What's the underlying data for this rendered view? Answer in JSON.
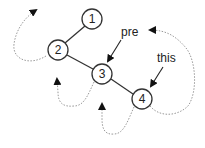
{
  "diagram": {
    "type": "binary-tree-traversal",
    "colors": {
      "edge": "#333333",
      "node_stroke": "#333333",
      "node_fill": "#ffffff",
      "traversal_path": "#999999",
      "arrowhead": "#111111",
      "text": "#222222"
    },
    "nodes": [
      {
        "id": "1",
        "label": "1",
        "cx": 92,
        "cy": 19
      },
      {
        "id": "2",
        "label": "2",
        "cx": 58,
        "cy": 50
      },
      {
        "id": "3",
        "label": "3",
        "cx": 102,
        "cy": 74
      },
      {
        "id": "4",
        "label": "4",
        "cx": 142,
        "cy": 99
      }
    ],
    "edges": [
      {
        "from": "1",
        "to": "2"
      },
      {
        "from": "2",
        "to": "3"
      },
      {
        "from": "3",
        "to": "4"
      }
    ],
    "pointers": [
      {
        "label": "pre",
        "target": "3"
      },
      {
        "label": "this",
        "target": "4"
      }
    ],
    "traversal_arrows": [
      {
        "from": "2",
        "description": "dotted curved arrow from node 2 looping left and up"
      },
      {
        "from": "3",
        "description": "dotted curved arrow from node 3 looping down-left and up"
      },
      {
        "from": "4",
        "description": "dotted curved arrow from node 4 looping down-left and up"
      },
      {
        "from": "4",
        "description": "dotted curved arrow from node 4 looping right and up toward 'pre'"
      }
    ]
  }
}
